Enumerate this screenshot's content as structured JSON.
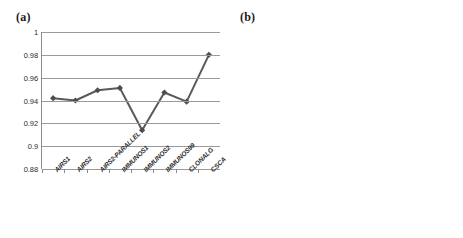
{
  "figure": {
    "panels": [
      {
        "id": "a",
        "label": "(a)"
      },
      {
        "id": "b",
        "label": "(b)"
      }
    ]
  },
  "chart_data": [
    {
      "type": "line",
      "panel_label": "(a)",
      "title": "",
      "xlabel": "",
      "ylabel": "",
      "ylim": [
        0.88,
        1
      ],
      "yticks": [
        0.88,
        0.9,
        0.92,
        0.94,
        0.96,
        0.98,
        1
      ],
      "ytick_labels": [
        "0.88",
        "0.9",
        "0.92",
        "0.94",
        "0.96",
        "0.98",
        "1"
      ],
      "grid": "horizontal",
      "legend": "none",
      "marker": "diamond",
      "line_color": "#5a5a5a",
      "categories": [
        "AIRS1",
        "AIRS2",
        "AIRS2-PARALLEL",
        "IMMUNOS1",
        "IMMUNOS2",
        "IMMUNOS99",
        "CLONALG",
        "CSCA"
      ],
      "values": [
        0.942,
        0.94,
        0.949,
        0.951,
        0.914,
        0.947,
        0.939,
        0.98
      ]
    },
    {
      "type": "bar",
      "panel_label": "(b)",
      "title": "",
      "xlabel": "",
      "ylabel": "",
      "ylim": [
        0,
        0.9
      ],
      "yticks": [
        0,
        0.1,
        0.2,
        0.3,
        0.4,
        0.5,
        0.6,
        0.7,
        0.8,
        0.9
      ],
      "ytick_labels": [
        "0",
        "0.1",
        "0.2",
        "0.3",
        "0.4",
        "0.5",
        "0.6",
        "0.7",
        "0.8",
        "0.9"
      ],
      "grid": "both",
      "legend": "none",
      "bar_color": "#7b7b7b",
      "categories": [
        "AIRS1",
        "AIRS2",
        "AIRS2PARALLEL",
        "IMMUNOS1",
        "IMMUNOS2",
        "IMMUNOS99",
        "CLONALG",
        "CSCA"
      ],
      "values": [
        0.7,
        0,
        0,
        0.77,
        0.49,
        0.765,
        0.49,
        0.6
      ]
    }
  ]
}
